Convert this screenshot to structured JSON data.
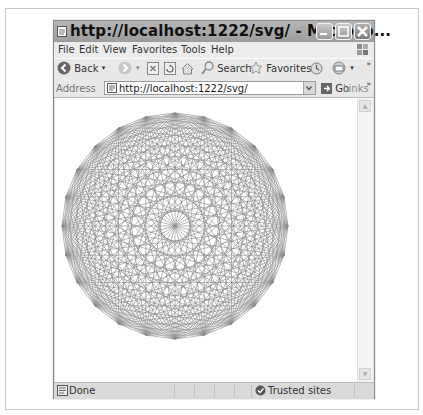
{
  "window": {
    "title": "http://localhost:1222/svg/ - Microso...",
    "controls": [
      "minimize",
      "maximize",
      "close"
    ]
  },
  "menu": {
    "items": [
      {
        "label": "File",
        "accel": "F"
      },
      {
        "label": "Edit",
        "accel": "E"
      },
      {
        "label": "View",
        "accel": "V"
      },
      {
        "label": "Favorites",
        "accel": "a"
      },
      {
        "label": "Tools",
        "accel": "T"
      },
      {
        "label": "Help",
        "accel": "H"
      }
    ]
  },
  "toolbar": {
    "back_label": "Back",
    "search_label": "Search",
    "favorites_label": "Favorites",
    "more": "»"
  },
  "address": {
    "label": "Address",
    "url": "http://localhost:1222/svg/",
    "go_label": "Go",
    "links_label": "Links",
    "more": "»"
  },
  "content": {
    "figure": "complete-graph",
    "vertices": 24,
    "stroke_color": "#8a8a8a",
    "background": "#ffffff"
  },
  "status": {
    "text": "Done",
    "zone": "Trusted sites"
  }
}
